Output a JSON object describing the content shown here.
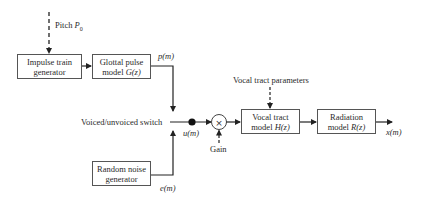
{
  "diagram": {
    "inputs": {
      "pitch": {
        "label": "Pitch",
        "symbol": "P",
        "subscript": "0"
      },
      "vocal_tract_parameters": {
        "label": "Vocal tract parameters"
      },
      "gain": {
        "label": "Gain"
      }
    },
    "blocks": {
      "impulse": {
        "line1": "Impulse train",
        "line2": "generator"
      },
      "glottal": {
        "line1": "Glottal pulse",
        "line2_text": "model ",
        "line2_math": "G(z)"
      },
      "noise": {
        "line1": "Random noise",
        "line2": "generator"
      },
      "vocal": {
        "line1": "Vocal tract",
        "line2_text": "model ",
        "line2_math": "H(z)"
      },
      "radiation": {
        "line1": "Radiation",
        "line2_text": "model ",
        "line2_math": "R(z)"
      }
    },
    "switch": {
      "label": "Voiced/unvoiced switch"
    },
    "multiplier": {
      "symbol": "×"
    },
    "signals": {
      "p": "p(m)",
      "e": "e(m)",
      "u": "u(m)",
      "x": "x(m)"
    },
    "colors": {
      "line": "#333333",
      "box_border": "#555555",
      "text": "#2a2a2a"
    }
  }
}
